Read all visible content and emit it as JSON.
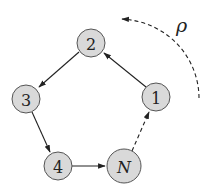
{
  "diagram": {
    "type": "directed cycle graph",
    "nodes": [
      {
        "id": "1",
        "label": "1",
        "x": 156,
        "y": 97,
        "r": 14
      },
      {
        "id": "2",
        "label": "2",
        "x": 91,
        "y": 43,
        "r": 14
      },
      {
        "id": "3",
        "label": "3",
        "x": 26,
        "y": 99,
        "r": 14
      },
      {
        "id": "4",
        "label": "4",
        "x": 58,
        "y": 166,
        "r": 14
      },
      {
        "id": "N",
        "label": "N",
        "x": 124,
        "y": 166,
        "r": 17
      }
    ],
    "edges": [
      {
        "from": "1",
        "to": "2",
        "style": "solid"
      },
      {
        "from": "2",
        "to": "3",
        "style": "solid"
      },
      {
        "from": "3",
        "to": "4",
        "style": "solid"
      },
      {
        "from": "4",
        "to": "N",
        "style": "solid"
      },
      {
        "from": "N",
        "to": "1",
        "style": "dashed"
      }
    ],
    "rotation_arrow": {
      "label": "ρ",
      "direction": "counter-clockwise",
      "style": "dashed"
    },
    "colors": {
      "node_fill": "#d9d9d9",
      "node_stroke": "#555555",
      "edge": "#222222"
    }
  }
}
